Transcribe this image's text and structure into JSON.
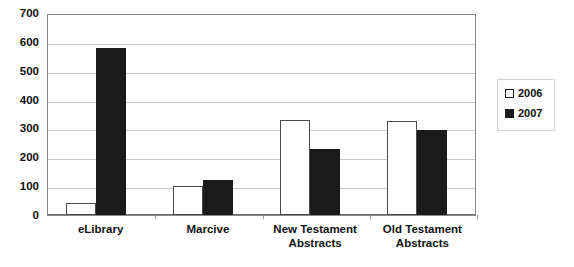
{
  "chart_data": {
    "type": "bar",
    "title": "",
    "xlabel": "",
    "ylabel": "",
    "ylim": [
      0,
      700
    ],
    "ytick_step": 100,
    "yticks": [
      700,
      600,
      500,
      400,
      300,
      200,
      100,
      0
    ],
    "grid": true,
    "legend_position": "right",
    "categories": [
      "eLibrary",
      "Marcive",
      "New Testament Abstracts",
      "Old Testament Abstracts"
    ],
    "series": [
      {
        "name": "2006",
        "color": "#ffffff",
        "edge_color": "#4a4a4a",
        "values": [
          40,
          100,
          330,
          325
        ]
      },
      {
        "name": "2007",
        "color": "#1a1a1a",
        "edge_color": "#1a1a1a",
        "values": [
          580,
          120,
          230,
          295
        ]
      }
    ]
  },
  "legend": {
    "items": [
      {
        "label": "2006",
        "swatch": "hollow-square-icon"
      },
      {
        "label": "2007",
        "swatch": "filled-square-icon"
      }
    ]
  },
  "colors": {
    "plot_border": "#8a8a8a",
    "gridline": "#c9c9c9",
    "axis": "#6e6e6e",
    "text": "#111111",
    "legend_border": "#d4d4d4",
    "background": "#ffffff"
  }
}
